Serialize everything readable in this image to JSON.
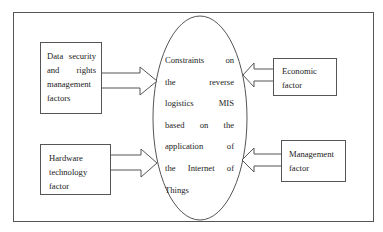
{
  "diagram": {
    "type": "influence-diagram",
    "center": {
      "shape": "ellipse",
      "lines": [
        "Constraints on",
        "the reverse",
        "logistics MIS",
        "based on the",
        "application of",
        "the Internet of",
        "Things"
      ]
    },
    "factors": [
      {
        "id": "data-security",
        "position": "left-top",
        "lines": [
          "Data security",
          "and rights",
          "management",
          "factors"
        ],
        "arrow_direction": "right"
      },
      {
        "id": "hardware-technology",
        "position": "left-bottom",
        "lines": [
          "Hardware",
          "technology",
          "factor"
        ],
        "arrow_direction": "right"
      },
      {
        "id": "economic",
        "position": "right-top",
        "lines": [
          "Economic",
          "factor"
        ],
        "arrow_direction": "left"
      },
      {
        "id": "management",
        "position": "right-bottom",
        "lines": [
          "Management",
          "factor"
        ],
        "arrow_direction": "left"
      }
    ],
    "colors": {
      "stroke": "#555555",
      "background": "#ffffff",
      "text": "#222222"
    }
  }
}
